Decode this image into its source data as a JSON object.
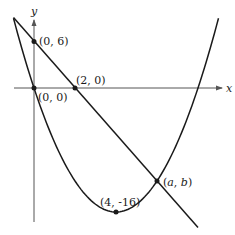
{
  "diagram": {
    "type": "coordinate-graph",
    "axes": {
      "x_label": "x",
      "y_label": "y"
    },
    "curves": [
      {
        "name": "parabola",
        "equation": "y = x^2 - 8x",
        "x_range": [
          -1,
          9
        ]
      },
      {
        "name": "line",
        "equation": "y = -3x + 6",
        "x_range": [
          -1,
          8
        ]
      }
    ],
    "points": [
      {
        "id": "y-intercept-line",
        "label": "(0, 6)",
        "x": 0,
        "y": 6
      },
      {
        "id": "origin",
        "label": "(0, 0)",
        "x": 0,
        "y": 0
      },
      {
        "id": "x-intercept-line",
        "label": "(2, 0)",
        "x": 2,
        "y": 0
      },
      {
        "id": "vertex",
        "label": "(4, -16)",
        "x": 4,
        "y": -16
      },
      {
        "id": "intersection",
        "label_a": "a",
        "label_b": "b",
        "x": 6,
        "y": -12
      }
    ],
    "colors": {
      "stroke": "#1a1a1a",
      "axis": "#555555",
      "background": "#ffffff"
    }
  },
  "labels": {
    "x_axis": "x",
    "y_axis": "y",
    "p06": "(0, 6)",
    "p00": "(0, 0)",
    "p20": "(2, 0)",
    "vertex": "(4, -16)",
    "ab_open": "(",
    "ab_a": "a",
    "ab_comma": ", ",
    "ab_b": "b",
    "ab_close": ")"
  }
}
